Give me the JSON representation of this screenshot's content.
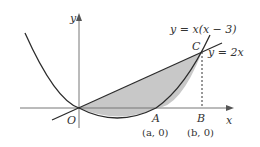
{
  "diagram": {
    "type": "function-graph",
    "axes": {
      "x_label": "x",
      "y_label": "y",
      "origin_label": "O"
    },
    "curves": [
      {
        "id": "parabola",
        "equation": "y = x(x − 3)"
      },
      {
        "id": "line",
        "equation": "y = 2x"
      }
    ],
    "points": {
      "C": {
        "label": "C"
      },
      "A": {
        "label": "A",
        "coords": "(a, 0)"
      },
      "B": {
        "label": "B",
        "coords": "(b, 0)"
      }
    },
    "shaded_region": "between y = 2x and y = x(x − 3) from O to C",
    "colors": {
      "stroke": "#2b2b2b",
      "axis": "#777777",
      "shade": "#c8c8c8"
    }
  }
}
